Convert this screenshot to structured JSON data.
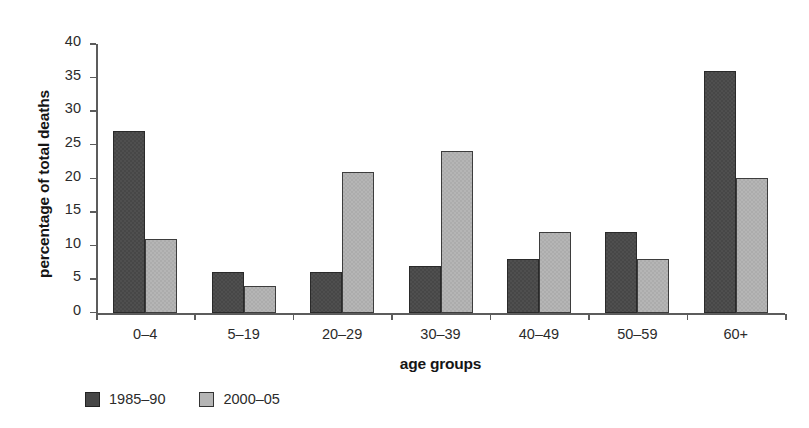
{
  "chart_data": {
    "type": "bar",
    "title": "",
    "subtitle": "",
    "xlabel": "age groups",
    "ylabel": "percentage of total deaths",
    "categories": [
      "0–4",
      "5–19",
      "20–29",
      "30–39",
      "40–49",
      "50–59",
      "60+"
    ],
    "series": [
      {
        "name": "1985–90",
        "color": "#474747",
        "values": [
          27,
          6,
          6,
          7,
          8,
          12,
          36
        ]
      },
      {
        "name": "2000–05",
        "color": "#b5b5b5",
        "values": [
          11,
          4,
          21,
          24,
          12,
          8,
          20
        ]
      }
    ],
    "ylim": [
      0,
      40
    ],
    "ytick_step": 5,
    "yticks": [
      0,
      5,
      10,
      15,
      20,
      25,
      30,
      35,
      40
    ],
    "ytick_labels": [
      "0",
      "5",
      "10",
      "15",
      "20",
      "25",
      "30",
      "35",
      "40"
    ],
    "grid": false,
    "legend_position": "bottom-left",
    "axis_color": "#5c5c5c",
    "background": "#ffffff"
  }
}
